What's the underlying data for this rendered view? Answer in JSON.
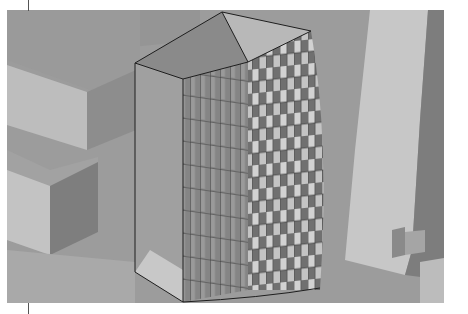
{
  "figure": {
    "colors": {
      "sky_ground": "#9a9a9a",
      "light_face": "#c9c9c9",
      "mid_face": "#a8a8a8",
      "dark_face": "#7c7c7c",
      "panel_dark": "#6e6e6e",
      "panel_light": "#d4d4d4",
      "edge": "#1e1e1e"
    }
  }
}
